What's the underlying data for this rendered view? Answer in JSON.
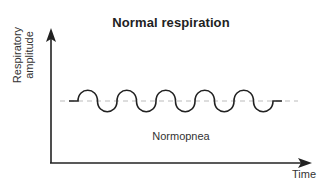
{
  "diagram": {
    "title": "Normal respiration",
    "y_axis_label_line1": "Respiratory",
    "y_axis_label_line2": "amplitude",
    "x_axis_label": "Time",
    "caption": "Normopnea",
    "waveform": {
      "type": "sinusoidal",
      "cycles": 5,
      "description": "regular, even-amplitude breathing waves around a dashed baseline"
    },
    "colors": {
      "axis": "#222222",
      "wave": "#222222",
      "baseline": "#bbbbbb"
    }
  }
}
